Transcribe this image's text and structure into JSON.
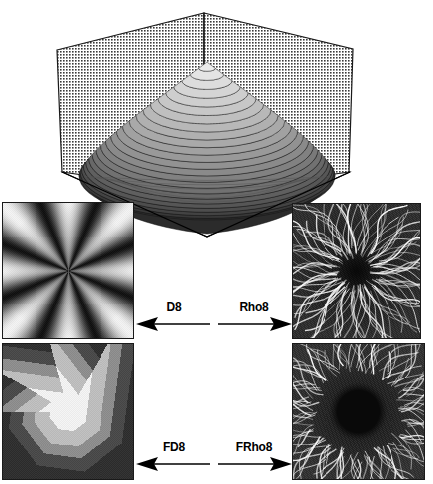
{
  "figure": {
    "title": "",
    "background": "#ffffff",
    "width": 433,
    "height": 484
  },
  "surface_plot": {
    "name": "distance-surface-3d",
    "type": "3d-surface",
    "description": "Mesh surface of a radially decreasing distance function rendered as contour-banded grayscale dome inside an open box with two halftone back walls and a diamond-shaped base.",
    "walls": {
      "fill": "#d9d9d9",
      "stroke": "#1a1a1a",
      "pattern": "halftone-dots"
    },
    "surface": {
      "band_count": 24,
      "light_gray": "#f2f2f2",
      "dark_gray": "#2b2b2b",
      "stroke": "#111111"
    },
    "base": {
      "stroke": "#000000",
      "fill": "#ffffff"
    }
  },
  "panels": [
    {
      "id": "panel-d8",
      "name": "panel-d8",
      "position": "top-left",
      "title": "D8",
      "kind": "radial-sector-gradient",
      "description": "Eight-fold radial starburst gradient: smoothly varying light and dark wedges meeting at the centre.",
      "sectors": 8,
      "background": "#111111",
      "highlight": "#f0f0f0"
    },
    {
      "id": "panel-rho8",
      "name": "panel-rho8",
      "position": "top-right",
      "title": "Rho8",
      "kind": "radial-streaks-sharp",
      "description": "Dark field crossed by thin bright white streaks radiating from a dark centre; fine dotted texture throughout.",
      "background": "#101010",
      "streak_color": "#f5f5f5",
      "streak_count": 120
    },
    {
      "id": "panel-fd8",
      "name": "panel-fd8",
      "position": "bottom-left",
      "title": "FD8",
      "kind": "quantized-polygon-levels",
      "description": "Concentric quantized octagonal level sets: bright near-white core, mid-gray ring, dark gray outer field.",
      "levels": [
        "#f0f0f0",
        "#bdbdbd",
        "#8d8d8d",
        "#4a4a4a",
        "#303030"
      ],
      "background": "#3a3a3a"
    },
    {
      "id": "panel-frho8",
      "name": "panel-frho8",
      "position": "bottom-right",
      "title": "FRho8",
      "kind": "radial-streaks-dark-core",
      "description": "Bright radiating streaks on a dark field with a distinctly darker circular core at the centre.",
      "background": "#141414",
      "streak_color": "#fafafa",
      "core_color": "#090909",
      "streak_count": 140
    }
  ],
  "arrows": {
    "top_row": [
      {
        "name": "arrow-d8",
        "label": "D8",
        "direction": "left"
      },
      {
        "name": "arrow-rho8",
        "label": "Rho8",
        "direction": "right"
      }
    ],
    "bottom_row": [
      {
        "name": "arrow-fd8",
        "label": "FD8",
        "direction": "left"
      },
      {
        "name": "arrow-frho8",
        "label": "FRho8",
        "direction": "right"
      }
    ]
  },
  "chart_data": {
    "type": "heatmap",
    "title": "",
    "panels": [
      "D8",
      "Rho8",
      "FD8",
      "FRho8"
    ],
    "labels": [
      "D8",
      "Rho8",
      "FD8",
      "FRho8"
    ],
    "legend": []
  }
}
